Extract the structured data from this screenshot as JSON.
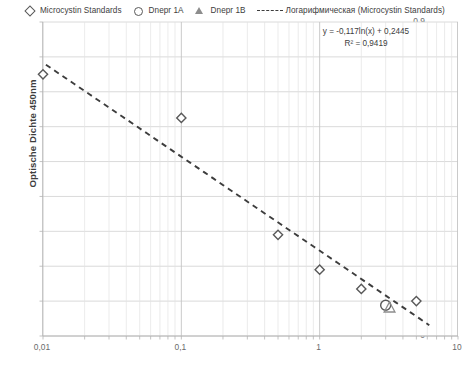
{
  "chart_data": {
    "type": "scatter",
    "title": "",
    "xlabel": "",
    "ylabel": "Optische Dichte 450nm",
    "xscale": "log",
    "xlim": [
      0.01,
      10
    ],
    "ylim": [
      0,
      0.9
    ],
    "grid": true,
    "legend_position": "top",
    "x_tick_labels": [
      "0,01",
      "0,1",
      "1",
      "10"
    ],
    "x_tick_values": [
      0.01,
      0.1,
      1,
      10
    ],
    "y_tick_labels": [
      "0",
      "0,1",
      "0,2",
      "0,3",
      "0,4",
      "0,5",
      "0,6",
      "0,7",
      "0,8",
      "0,9"
    ],
    "y_tick_values": [
      0,
      0.1,
      0.2,
      0.3,
      0.4,
      0.5,
      0.6,
      0.7,
      0.8,
      0.9
    ],
    "series": [
      {
        "name": "Microcystin Standards",
        "marker": "diamond",
        "color": "#595959",
        "points": [
          {
            "x": 0.01,
            "y": 0.75
          },
          {
            "x": 0.1,
            "y": 0.625
          },
          {
            "x": 0.5,
            "y": 0.29
          },
          {
            "x": 1.0,
            "y": 0.19
          },
          {
            "x": 2.0,
            "y": 0.135
          },
          {
            "x": 5.0,
            "y": 0.1
          }
        ]
      },
      {
        "name": "Dnepr 1A",
        "marker": "circle",
        "color": "#595959",
        "points": [
          {
            "x": 3.0,
            "y": 0.088
          }
        ]
      },
      {
        "name": "Dnepr 1B",
        "marker": "triangle",
        "color": "#8d8d8d",
        "points": [
          {
            "x": 3.2,
            "y": 0.082
          }
        ]
      }
    ],
    "trendline": {
      "name": "Логарифмическая (Microcystin Standards)",
      "style": "dashed",
      "color": "#3d3d3d",
      "equation": "y = -0,117ln(x) + 0,2445",
      "r_squared": "R² = 0,9419",
      "slope": -0.117,
      "intercept": 0.2445,
      "x_start": 0.0105,
      "x_end": 6.2
    }
  },
  "legend": {
    "entries": [
      {
        "label": "Microcystin Standards",
        "key": "diamond-marker-icon"
      },
      {
        "label": "Dnepr 1A",
        "key": "circle-marker-icon"
      },
      {
        "label": "Dnepr 1B",
        "key": "triangle-marker-icon"
      },
      {
        "label": "Логарифмическая (Microcystin Standards)",
        "key": "dashed-line-icon"
      }
    ]
  },
  "annotation": {
    "equation": "y = -0,117ln(x) + 0,2445",
    "r_squared": "R² = 0,9419"
  },
  "axes": {
    "y_title": "Optische Dichte 450nm"
  }
}
